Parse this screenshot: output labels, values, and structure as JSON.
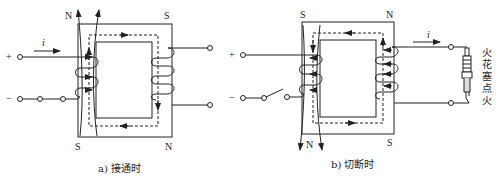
{
  "diagram": {
    "type": "transformer-ignition-coil",
    "colors": {
      "line": "#222222",
      "background": "#ffffff"
    },
    "panel_a": {
      "caption": "a) 接通时",
      "current_label": "i",
      "terminal_plus": "+",
      "terminal_minus": "−",
      "pole_top_left": "N",
      "pole_top_right": "S",
      "pole_bottom_left": "S",
      "pole_bottom_right": "N"
    },
    "panel_b": {
      "caption": "b) 切断时",
      "current_label": "i",
      "terminal_plus": "+",
      "terminal_minus": "−",
      "pole_top_left": "S",
      "pole_top_right": "N",
      "pole_bottom_left": "N",
      "pole_bottom_right": "S",
      "spark_plug_label": [
        "火",
        "花",
        "塞",
        "点",
        "火"
      ]
    }
  }
}
